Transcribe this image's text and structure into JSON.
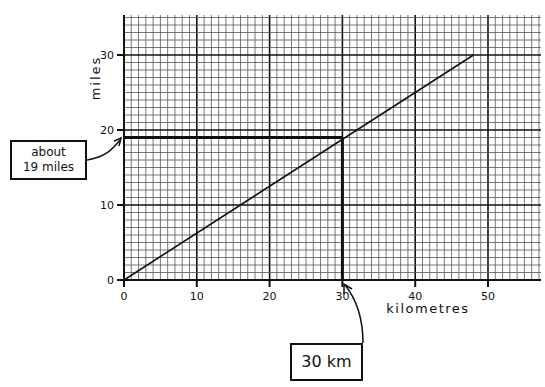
{
  "chart_data": {
    "type": "line",
    "title": "",
    "xlabel": "kilometres",
    "ylabel": "miles",
    "xlim": [
      0,
      57
    ],
    "ylim": [
      0,
      35
    ],
    "x_ticks": [
      "0",
      "10",
      "20",
      "30",
      "40",
      "50"
    ],
    "y_ticks": [
      "0",
      "10",
      "20",
      "30"
    ],
    "grid": true,
    "grid_minor_step": 2,
    "series": [
      {
        "name": "km to miles conversion",
        "x": [
          0,
          48
        ],
        "y": [
          0,
          30
        ]
      }
    ],
    "annotations": [
      {
        "type": "reading-line",
        "x": 30,
        "y": 19,
        "label_x": "30 km",
        "label_y": "about 19 miles"
      }
    ]
  },
  "annotations": {
    "miles_box_line1": "about",
    "miles_box_line2": "19 miles",
    "km_box": "30 km"
  },
  "axes": {
    "x_label": "kilometres",
    "y_label": "miles"
  }
}
